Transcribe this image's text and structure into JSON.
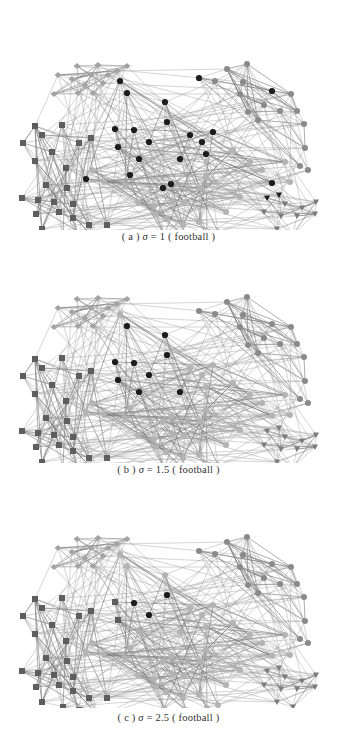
{
  "figure": {
    "panels": [
      {
        "id": "a",
        "caption_prefix": "( a )",
        "caption_symbol": "σ",
        "caption_eq": "= 1",
        "caption_dataset": "( football )",
        "sigma": 1,
        "dataset": "football",
        "top": 30
      },
      {
        "id": "b",
        "caption_prefix": "( b )",
        "caption_symbol": "σ",
        "caption_eq": "= 1.5",
        "caption_dataset": "( football )",
        "sigma": 1.5,
        "dataset": "football",
        "top": 263
      },
      {
        "id": "c",
        "caption_prefix": "( c )",
        "caption_symbol": "σ",
        "caption_eq": "= 2.5",
        "caption_dataset": "( football )",
        "sigma": 2.5,
        "dataset": "football",
        "top": 493
      }
    ],
    "node_styles": {
      "diamond": {
        "shape": "diamond",
        "color": "#a3a3a3"
      },
      "square": {
        "shape": "square",
        "color": "#5e5e5e"
      },
      "black": {
        "shape": "circle",
        "color": "#1c1c1c"
      },
      "gray": {
        "shape": "circle",
        "color": "#8a8a8a"
      },
      "light": {
        "shape": "circle",
        "color": "#b3b3b3"
      },
      "triangle": {
        "shape": "triangle-down",
        "color": "#7a7a7a"
      }
    },
    "base_nodes": {
      "diamond": [
        [
          77,
          44
        ],
        [
          98,
          43
        ],
        [
          127,
          44
        ],
        [
          58,
          53
        ],
        [
          72,
          57
        ],
        [
          91,
          53
        ],
        [
          108,
          53
        ],
        [
          117,
          49
        ],
        [
          54,
          72
        ],
        [
          78,
          71
        ],
        [
          93,
          71
        ],
        [
          103,
          61
        ],
        [
          85,
          63
        ]
      ],
      "square": [
        [
          35,
          104
        ],
        [
          62,
          103
        ],
        [
          42,
          113
        ],
        [
          23,
          121
        ],
        [
          52,
          130
        ],
        [
          79,
          121
        ],
        [
          91,
          116
        ],
        [
          35,
          139
        ],
        [
          66,
          146
        ],
        [
          46,
          163
        ],
        [
          67,
          166
        ],
        [
          22,
          176
        ],
        [
          38,
          178
        ],
        [
          54,
          180
        ],
        [
          73,
          182
        ],
        [
          36,
          192
        ],
        [
          59,
          190
        ],
        [
          73,
          196
        ],
        [
          89,
          203
        ],
        [
          107,
          203
        ],
        [
          42,
          207
        ],
        [
          63,
          212
        ],
        [
          79,
          215
        ],
        [
          99,
          222
        ]
      ],
      "gray": [
        [
          227,
          47
        ],
        [
          247,
          42
        ],
        [
          215,
          59
        ],
        [
          243,
          60
        ],
        [
          240,
          72
        ],
        [
          291,
          72
        ],
        [
          248,
          90
        ],
        [
          264,
          83
        ],
        [
          280,
          89
        ],
        [
          297,
          89
        ],
        [
          258,
          98
        ],
        [
          304,
          102
        ],
        [
          305,
          126
        ],
        [
          300,
          144
        ],
        [
          308,
          148
        ],
        [
          199,
          56
        ],
        [
          272,
          69
        ]
      ],
      "light": [
        [
          92,
          148
        ],
        [
          104,
          160
        ],
        [
          125,
          163
        ],
        [
          138,
          180
        ],
        [
          154,
          184
        ],
        [
          184,
          180
        ],
        [
          206,
          155
        ],
        [
          200,
          166
        ],
        [
          215,
          160
        ],
        [
          156,
          192
        ],
        [
          173,
          180
        ],
        [
          166,
          197
        ],
        [
          183,
          203
        ],
        [
          199,
          200
        ],
        [
          207,
          213
        ],
        [
          218,
          210
        ],
        [
          164,
          213
        ],
        [
          186,
          215
        ],
        [
          226,
          190
        ],
        [
          240,
          175
        ],
        [
          120,
          59
        ],
        [
          127,
          71
        ],
        [
          165,
          80
        ],
        [
          167,
          100
        ],
        [
          115,
          107
        ],
        [
          134,
          108
        ],
        [
          149,
          120
        ],
        [
          118,
          125
        ],
        [
          139,
          137
        ],
        [
          180,
          137
        ],
        [
          130,
          153
        ],
        [
          86,
          157
        ],
        [
          163,
          166
        ],
        [
          171,
          162
        ],
        [
          190,
          113
        ],
        [
          213,
          110
        ],
        [
          202,
          120
        ],
        [
          206,
          132
        ],
        [
          272,
          161
        ],
        [
          233,
          128
        ],
        [
          250,
          140
        ],
        [
          262,
          148
        ],
        [
          285,
          140
        ],
        [
          290,
          160
        ]
      ],
      "triangle": [
        [
          267,
          176
        ],
        [
          279,
          173
        ],
        [
          285,
          182
        ],
        [
          264,
          190
        ],
        [
          281,
          194
        ],
        [
          297,
          194
        ],
        [
          316,
          180
        ],
        [
          315,
          192
        ],
        [
          277,
          207
        ],
        [
          293,
          212
        ],
        [
          302,
          186
        ]
      ]
    },
    "black_overrides": {
      "a": [
        [
          120,
          59
        ],
        [
          127,
          71
        ],
        [
          165,
          80
        ],
        [
          167,
          100
        ],
        [
          115,
          107
        ],
        [
          134,
          108
        ],
        [
          149,
          120
        ],
        [
          118,
          125
        ],
        [
          139,
          137
        ],
        [
          180,
          137
        ],
        [
          130,
          153
        ],
        [
          86,
          157
        ],
        [
          163,
          166
        ],
        [
          171,
          162
        ],
        [
          199,
          56
        ],
        [
          190,
          113
        ],
        [
          213,
          110
        ],
        [
          202,
          120
        ],
        [
          206,
          132
        ],
        [
          272,
          69
        ],
        [
          272,
          161
        ],
        [
          267,
          176
        ],
        [
          279,
          173
        ]
      ],
      "b": [
        [
          127,
          71
        ],
        [
          165,
          80
        ],
        [
          167,
          100
        ],
        [
          115,
          107
        ],
        [
          134,
          108
        ],
        [
          149,
          120
        ],
        [
          118,
          125
        ],
        [
          139,
          137
        ],
        [
          180,
          137
        ]
      ],
      "c": [
        [
          134,
          108
        ],
        [
          149,
          120
        ],
        [
          167,
          100
        ]
      ]
    },
    "square_overrides": {
      "c": [
        [
          115,
          107
        ],
        [
          118,
          125
        ]
      ]
    }
  }
}
